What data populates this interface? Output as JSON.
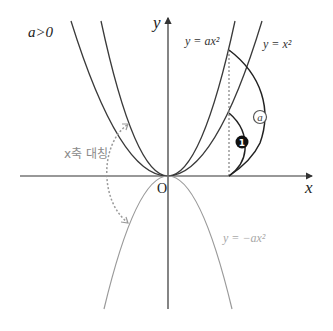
{
  "condition_label": "a>0",
  "axes": {
    "x_label": "x",
    "y_label": "y",
    "origin_label": "O"
  },
  "curves": {
    "ax2": {
      "label": "y = ax²",
      "color": "#3a3a3a"
    },
    "x2": {
      "label": "y = x²",
      "color": "#3a3a3a"
    },
    "neg_ax2": {
      "label": "y = −ax²",
      "color": "#9a9a9a"
    }
  },
  "annotations": {
    "symmetry_label": "x축 대칭",
    "marker_1": "1",
    "marker_a": "a"
  },
  "colors": {
    "axis": "#333333",
    "dark_curve": "#3a3a3a",
    "light_curve": "#9a9a9a",
    "dotted": "#9a9a9a",
    "marker_fill": "#111111"
  }
}
